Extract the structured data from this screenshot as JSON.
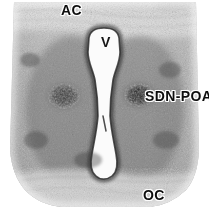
{
  "figure": {
    "kind": "photomicrograph",
    "modality": "Nissl-stained coronal brain section",
    "width_px": 209,
    "height_px": 209,
    "background_color": "#ffffff",
    "tissue_tone": "#9a9a9a",
    "label_color": "#0d0d0d",
    "label_halo_color": "#fdfdfd"
  },
  "labels": {
    "anterior_commissure": "AC",
    "ventricle": "V",
    "sexually_dimorphic_nucleus": "SDN-POA",
    "optic_chiasm": "OC"
  },
  "regions": {
    "ventricle_fill": "#fbfbfb",
    "nucleus_fill": "#4a4a4a",
    "commissure_fill": "#d6d6d6"
  }
}
